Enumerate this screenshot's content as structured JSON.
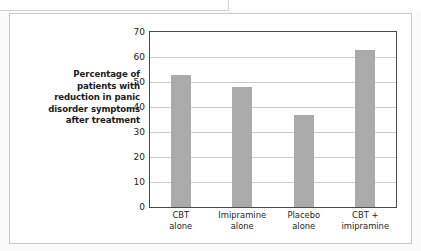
{
  "figure": {
    "background_color": "#ffffff",
    "frame_color": "#c9c9c9",
    "bar_color": "#aaaaaa",
    "grid_color": "#cccccc",
    "axis_color": "#4a4a4a"
  },
  "chart_data": {
    "type": "bar",
    "title": "",
    "subtitle": "",
    "xlabel": "",
    "ylabel": "Percentage of patients with reduction in panic disorder symptoms after treatment",
    "ylabel_lines": [
      "Percentage of",
      "patients with",
      "reduction in panic",
      "disorder symptoms",
      "after treatment"
    ],
    "categories": [
      "CBT alone",
      "Imipramine alone",
      "Placebo alone",
      "CBT + imipramine"
    ],
    "category_lines": [
      [
        "CBT",
        "alone"
      ],
      [
        "Imipramine",
        "alone"
      ],
      [
        "Placebo",
        "alone"
      ],
      [
        "CBT +",
        "imipramine"
      ]
    ],
    "values": [
      53,
      48,
      37,
      63
    ],
    "ylim": [
      0,
      70
    ],
    "ytick_values": [
      0,
      10,
      20,
      30,
      40,
      50,
      60,
      70
    ],
    "ytick_labels": [
      "0",
      "10",
      "20",
      "30",
      "40",
      "50",
      "60",
      "70"
    ],
    "grid": "horizontal",
    "legend": "none",
    "legend_entries": [],
    "annotations": []
  }
}
